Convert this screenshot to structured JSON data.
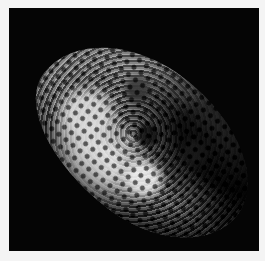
{
  "image": {
    "subject": "irregular cratered moon (sponge-like surface) against black space",
    "background_color": "#050505",
    "border_color": "#f4f4f4"
  }
}
